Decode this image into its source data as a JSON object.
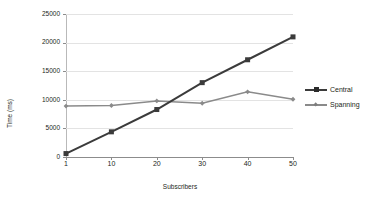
{
  "chart_data": {
    "type": "line",
    "title": "",
    "xlabel": "Subscribers",
    "ylabel": "Time (ms)",
    "categories": [
      "1",
      "10",
      "20",
      "30",
      "40",
      "50"
    ],
    "x": [
      1,
      10,
      20,
      30,
      40,
      50
    ],
    "ylim": [
      0,
      25000
    ],
    "yticks": [
      "0",
      "5000",
      "10000",
      "15000",
      "20000",
      "25000"
    ],
    "ytick_values": [
      0,
      5000,
      10000,
      15000,
      20000,
      25000
    ],
    "grid": "horizontal",
    "legend_position": "right",
    "series": [
      {
        "name": "Central",
        "color": "#3b3b3b",
        "marker": "square",
        "values": [
          600,
          4400,
          8300,
          13000,
          17000,
          21000
        ]
      },
      {
        "name": "Spanning",
        "color": "#8a8a8a",
        "marker": "diamond",
        "values": [
          8900,
          9000,
          9800,
          9400,
          11400,
          10100
        ]
      }
    ]
  },
  "legend": {
    "items": [
      {
        "label": "Central"
      },
      {
        "label": "Spanning"
      }
    ]
  },
  "colors": {
    "background": "#ffffff",
    "gridline": "#e3e3e3",
    "axis": "#8c8c8c",
    "text": "#231f20",
    "central": "#3b3b3b",
    "spanning": "#8a8a8a"
  }
}
